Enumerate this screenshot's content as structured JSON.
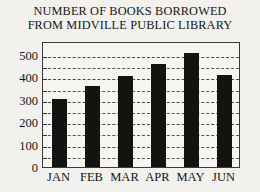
{
  "chart_data": {
    "type": "bar",
    "title": "NUMBER OF BOOKS BORROWED FROM MIDVILLE PUBLIC LIBRARY",
    "title_lines": [
      "NUMBER OF BOOKS BORROWED",
      "FROM MIDVILLE PUBLIC LIBRARY"
    ],
    "categories": [
      "JAN",
      "FEB",
      "MAR",
      "APR",
      "MAY",
      "JUN"
    ],
    "values": [
      305,
      360,
      408,
      460,
      510,
      410
    ],
    "xlabel": "",
    "ylabel": "",
    "ylim": [
      0,
      562
    ],
    "ytick_labels": [
      "0",
      "100",
      "200",
      "300",
      "400",
      "500"
    ],
    "ytick_values": [
      0,
      100,
      200,
      300,
      400,
      500
    ],
    "minor_tick_step": 50,
    "grid": true,
    "grid_style": "dashed",
    "grid_axis": "y",
    "legend": false,
    "legend_position": "none",
    "bar_color": "#131311",
    "grid_color": "#4a4a47",
    "frame_color": "#3a3a38",
    "plot_background": "#f6f5f2",
    "page_background": "#f2f1ee"
  }
}
